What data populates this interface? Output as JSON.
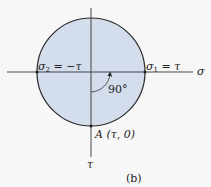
{
  "diagram": {
    "type": "mohr-circle",
    "colors": {
      "background": "#f7f7f7",
      "circle_fill": "#d3ddec",
      "stroke": "#222222"
    },
    "axes": {
      "horizontal_label": "σ",
      "vertical_label": "τ"
    },
    "labels": {
      "sigma2": "σ",
      "sigma2_sub": "2",
      "sigma2_rest": " = −τ",
      "sigma1": "σ",
      "sigma1_sub": "1",
      "sigma1_rest": " = τ",
      "angle": "90°",
      "point_a": "A (τ, 0)",
      "caption": "(b)"
    }
  }
}
